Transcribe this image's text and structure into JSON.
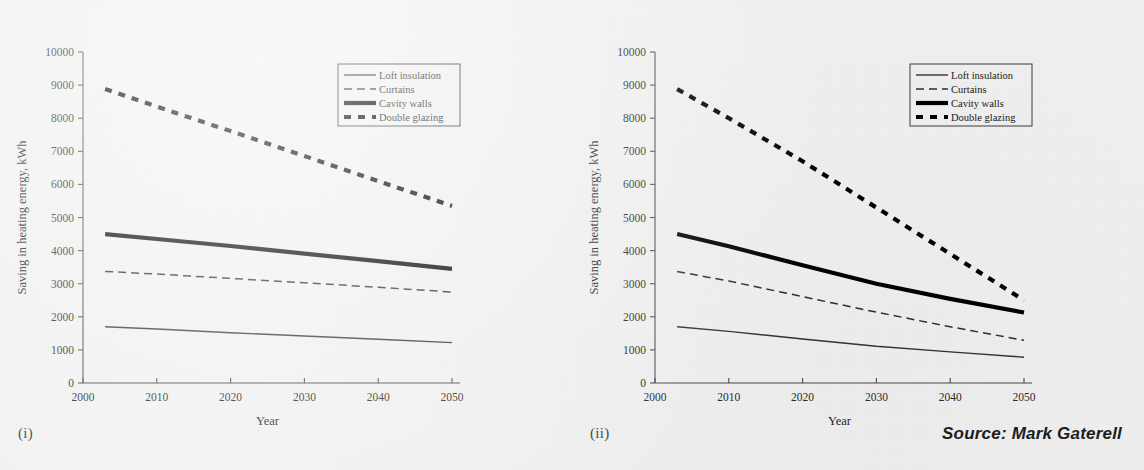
{
  "figure": {
    "source_note": "Source: Mark Gaterell",
    "panels": [
      {
        "tag": "(i)"
      },
      {
        "tag": "(ii)"
      }
    ]
  },
  "chart_data": [
    {
      "type": "line",
      "panel_tag": "(i)",
      "title": "",
      "xlabel": "Year",
      "ylabel": "Saving in heating energy, kWh",
      "xlim": [
        2000,
        2050
      ],
      "ylim": [
        0,
        10000
      ],
      "xticks": [
        2000,
        2010,
        2020,
        2030,
        2040,
        2050
      ],
      "yticks": [
        0,
        1000,
        2000,
        3000,
        4000,
        5000,
        6000,
        7000,
        8000,
        9000,
        10000
      ],
      "grid": false,
      "legend_position": "top-right",
      "x": [
        2003,
        2010,
        2020,
        2030,
        2040,
        2050
      ],
      "series": [
        {
          "name": "Loft insulation",
          "style": "thin-solid",
          "values": [
            1700,
            1630,
            1520,
            1420,
            1320,
            1220
          ]
        },
        {
          "name": "Curtains",
          "style": "thin-dashed",
          "values": [
            3370,
            3290,
            3160,
            3030,
            2890,
            2750
          ]
        },
        {
          "name": "Cavity walls",
          "style": "thick-solid",
          "values": [
            4500,
            4350,
            4140,
            3910,
            3680,
            3450
          ]
        },
        {
          "name": "Double glazing",
          "style": "thick-dotted",
          "values": [
            8880,
            8350,
            7610,
            6860,
            6100,
            5350
          ]
        }
      ]
    },
    {
      "type": "line",
      "panel_tag": "(ii)",
      "title": "",
      "xlabel": "Year",
      "ylabel": "Saving in heating energy, kWh",
      "xlim": [
        2000,
        2050
      ],
      "ylim": [
        0,
        10000
      ],
      "xticks": [
        2000,
        2010,
        2020,
        2030,
        2040,
        2050
      ],
      "yticks": [
        0,
        1000,
        2000,
        3000,
        4000,
        5000,
        6000,
        7000,
        8000,
        9000,
        10000
      ],
      "grid": false,
      "legend_position": "top-right",
      "x": [
        2003,
        2010,
        2020,
        2030,
        2040,
        2050
      ],
      "series": [
        {
          "name": "Loft insulation",
          "style": "thin-solid",
          "values": [
            1700,
            1560,
            1330,
            1110,
            940,
            780
          ]
        },
        {
          "name": "Curtains",
          "style": "thin-dashed",
          "values": [
            3370,
            3080,
            2610,
            2140,
            1700,
            1290
          ]
        },
        {
          "name": "Cavity walls",
          "style": "thick-solid",
          "values": [
            4500,
            4130,
            3560,
            3000,
            2540,
            2130
          ]
        },
        {
          "name": "Double glazing",
          "style": "thick-dotted",
          "values": [
            8880,
            8000,
            6700,
            5300,
            3900,
            2500
          ]
        }
      ]
    }
  ],
  "legend": {
    "entries": [
      {
        "label": "Loft insulation",
        "style": "thin-solid"
      },
      {
        "label": "Curtains",
        "style": "thin-dashed"
      },
      {
        "label": "Cavity walls",
        "style": "thick-solid"
      },
      {
        "label": "Double glazing",
        "style": "thick-dotted"
      }
    ]
  },
  "colors": {
    "background": "#f1f1f1",
    "ink": "#1a1a1a",
    "axis": "#4a4a4a"
  }
}
